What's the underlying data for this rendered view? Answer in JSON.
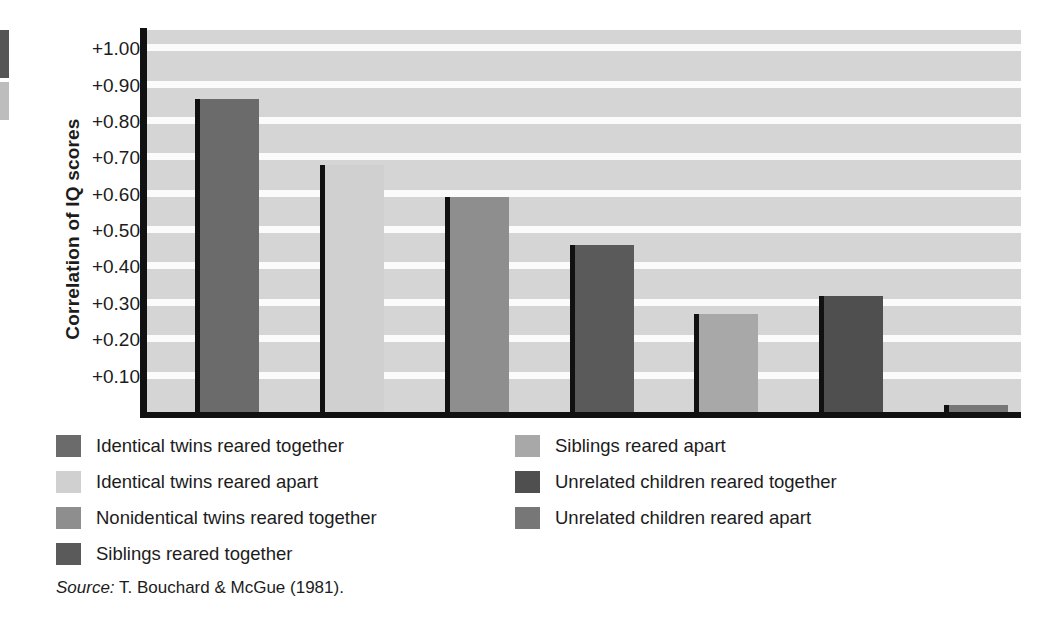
{
  "chart_data": {
    "type": "bar",
    "title": "",
    "xlabel": "",
    "ylabel": "Correlation of IQ scores",
    "ylim": [
      0,
      1.05
    ],
    "grid": true,
    "legend_position": "below-two-columns",
    "categories": [
      "Identical twins reared together",
      "Identical twins reared apart",
      "Nonidentical twins reared together",
      "Siblings reared together",
      "Siblings reared apart",
      "Unrelated children reared together",
      "Unrelated children reared apart"
    ],
    "values": [
      0.86,
      0.68,
      0.59,
      0.46,
      0.27,
      0.32,
      0.02
    ],
    "bar_colors": [
      "#6b6b6b",
      "#d0d0d0",
      "#8e8e8e",
      "#5a5a5a",
      "#a8a8a8",
      "#4f4f4f",
      "#777777"
    ],
    "tick_labels": [
      "+1.00",
      "+0.90",
      "+0.80",
      "+0.70",
      "+0.60",
      "+0.50",
      "+0.40",
      "+0.30",
      "+0.20",
      "+0.10"
    ],
    "tick_values": [
      1.0,
      0.9,
      0.8,
      0.7,
      0.6,
      0.5,
      0.4,
      0.3,
      0.2,
      0.1
    ],
    "axis_color": "#111111",
    "plot_background": "#d5d5d5",
    "gridline_color": "#fbfbfb"
  },
  "legend": {
    "left_column": [
      {
        "label": "Identical twins reared together",
        "color": "#6b6b6b"
      },
      {
        "label": "Identical twins reared apart",
        "color": "#d0d0d0"
      },
      {
        "label": "Nonidentical twins reared together",
        "color": "#8e8e8e"
      },
      {
        "label": "Siblings reared together",
        "color": "#5a5a5a"
      }
    ],
    "right_column": [
      {
        "label": "Siblings reared apart",
        "color": "#a8a8a8"
      },
      {
        "label": "Unrelated children reared together",
        "color": "#4f4f4f"
      },
      {
        "label": "Unrelated children reared apart",
        "color": "#777777"
      }
    ]
  },
  "source": {
    "prefix": "Source:",
    "text": " T. Bouchard & McGue (1981)."
  }
}
